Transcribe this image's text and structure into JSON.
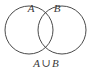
{
  "figure": {
    "kind": "venn-diagram",
    "width": 92,
    "height": 72,
    "background_color": "#ffffff",
    "stroke_color": "#4a4a4a",
    "text_color": "#3a3a3a",
    "stroke_width": 1,
    "fill_color": "none"
  },
  "sets": [
    {
      "id": "set-a",
      "label": "A",
      "label_x": 31,
      "label_y": 12,
      "circle": {
        "cx": 29,
        "cy": 30,
        "r": 24
      }
    },
    {
      "id": "set-b",
      "label": "B",
      "label_x": 57,
      "label_y": 12,
      "circle": {
        "cx": 62,
        "cy": 30,
        "r": 24
      }
    }
  ],
  "caption": {
    "full_text": "A ∪ B",
    "left_operand": "A",
    "operator": "∪",
    "operator_name": "union",
    "right_operand": "B",
    "x": 46,
    "y": 67
  }
}
